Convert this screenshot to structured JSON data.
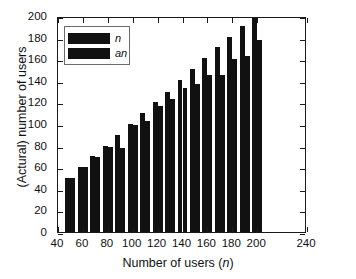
{
  "chart_data": {
    "type": "bar",
    "title": "",
    "subtitle": "",
    "xlabel": "Number of users (n)",
    "ylabel": "(Actural) number of users",
    "xlim": [
      40,
      240
    ],
    "ylim": [
      0,
      200
    ],
    "xticks": [
      40,
      60,
      80,
      100,
      120,
      140,
      160,
      180,
      200,
      240
    ],
    "yticks": [
      0,
      20,
      40,
      60,
      80,
      100,
      120,
      140,
      160,
      180,
      200
    ],
    "grid": false,
    "legend_position": "top-left",
    "bar_color": "#111111",
    "categories": [
      50,
      60,
      70,
      80,
      90,
      100,
      110,
      120,
      130,
      140,
      150,
      160,
      170,
      180,
      190,
      200
    ],
    "series": [
      {
        "name": "n",
        "values": [
          50,
          60,
          70,
          80,
          90,
          100,
          110,
          120,
          130,
          141,
          151,
          161,
          171,
          181,
          191,
          200
        ]
      },
      {
        "name": "an",
        "values": [
          50,
          60,
          69,
          79,
          78,
          99,
          103,
          117,
          123,
          133,
          137,
          145,
          145,
          160,
          163,
          178
        ]
      }
    ],
    "legend_entries": [
      "n",
      "an"
    ]
  },
  "axis": {
    "x_title_prefix": "Number of users (",
    "x_title_italic": "n",
    "x_title_suffix": ")",
    "y_title": "(Actural) number of users"
  },
  "legend": {
    "entry_1": "n",
    "entry_2": "an"
  }
}
